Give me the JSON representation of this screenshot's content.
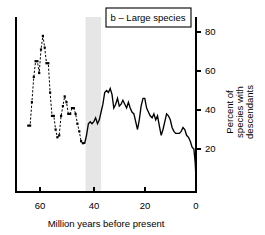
{
  "figure": {
    "panel_label": "b – Large species",
    "background": "#ffffff",
    "line_color": "#000000",
    "band_color": "#e6e6e6"
  },
  "chart_data": {
    "type": "line",
    "title": "b – Large species",
    "xlabel": "Million years before present",
    "ylabel": "Percent of species with descendants",
    "xlim": [
      65,
      0
    ],
    "ylim": [
      0,
      88
    ],
    "x_ticks": [
      60,
      40,
      20,
      0
    ],
    "y_ticks": [
      20,
      40,
      60,
      80
    ],
    "x_axis_reversed": true,
    "grid": false,
    "legend_position": "top-right",
    "annotations": [
      {
        "type": "vertical-band",
        "label": "shaded interval",
        "x_start": 42.5,
        "x_end": 36.5,
        "color": "#e6e6e6"
      }
    ],
    "series": [
      {
        "name": "Percent of large species with descendants",
        "marker": "square",
        "linestyle_early": "dashed",
        "linestyle_late": "solid",
        "x": [
          64.5,
          63.8,
          63.1,
          62.4,
          61.7,
          61.0,
          60.3,
          59.6,
          58.9,
          58.2,
          57.5,
          56.8,
          56.1,
          55.4,
          54.7,
          54.0,
          53.3,
          52.6,
          51.9,
          51.2,
          50.5,
          49.8,
          49.1,
          48.4,
          47.7,
          47.0,
          46.3,
          45.6,
          44.9,
          44.2,
          43.5,
          42.8,
          42.1,
          41.4,
          40.7,
          40.0,
          39.3,
          38.6,
          37.9,
          37.2,
          36.5,
          35.8,
          35.1,
          34.4,
          33.7,
          33.0,
          32.3,
          31.6,
          30.9,
          30.2,
          29.5,
          28.8,
          28.1,
          27.4,
          26.7,
          26.0,
          25.3,
          24.6,
          23.9,
          23.2,
          22.5,
          21.8,
          21.1,
          20.4,
          19.7,
          19.0,
          18.3,
          17.6,
          16.9,
          16.2,
          15.5,
          14.8,
          14.1,
          13.4,
          12.7,
          12.0,
          11.3,
          10.6,
          9.9,
          9.2,
          8.5,
          7.8,
          7.1,
          6.4,
          5.7,
          5.0,
          4.3,
          3.6,
          2.9,
          2.2,
          1.5,
          0.8,
          0.3,
          0.0
        ],
        "y": [
          32.0,
          32.0,
          44.0,
          57.0,
          65.0,
          65.0,
          59.0,
          71.0,
          78.0,
          72.0,
          64.0,
          64.0,
          49.0,
          37.0,
          37.0,
          30.0,
          26.0,
          27.0,
          37.0,
          42.0,
          47.0,
          44.0,
          38.0,
          38.0,
          41.0,
          41.0,
          38.0,
          33.0,
          29.0,
          24.0,
          23.0,
          23.0,
          27.0,
          33.0,
          34.0,
          33.0,
          34.0,
          36.0,
          33.0,
          35.0,
          39.0,
          43.0,
          49.0,
          50.0,
          49.0,
          51.0,
          48.0,
          41.0,
          43.0,
          46.0,
          42.0,
          43.0,
          45.0,
          43.0,
          41.0,
          44.0,
          41.0,
          39.0,
          38.0,
          34.0,
          30.0,
          35.0,
          42.0,
          46.0,
          46.0,
          41.0,
          39.0,
          37.0,
          36.0,
          38.0,
          35.0,
          37.0,
          32.0,
          27.0,
          30.0,
          34.0,
          38.0,
          37.0,
          35.0,
          31.0,
          29.0,
          28.0,
          28.0,
          28.0,
          29.0,
          31.0,
          30.0,
          27.0,
          26.0,
          24.0,
          21.0,
          20.0,
          13.0,
          5.0
        ]
      }
    ]
  }
}
